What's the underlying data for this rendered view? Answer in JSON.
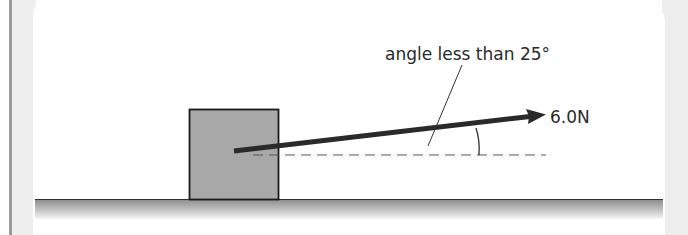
{
  "diagram": {
    "type": "force-diagram",
    "annotation_label": "angle less than 25°",
    "force_label": "6.0N",
    "elements": {
      "block": {
        "fill": "#a8a8a8",
        "stroke": "#1a1a1a"
      },
      "force_arrow": {
        "color": "#2a2a2a",
        "magnitude_text": "6.0N"
      },
      "horizontal_reference": {
        "style": "dashed",
        "color": "#555555"
      },
      "ground": {
        "line_color": "#333333",
        "gradient_top": "#8c8c8c",
        "gradient_bottom": "#f4f4f4"
      }
    }
  }
}
